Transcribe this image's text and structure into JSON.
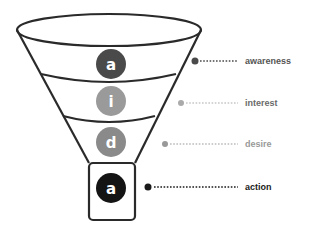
{
  "diagram": {
    "type": "funnel",
    "stages": [
      {
        "letter": "a",
        "label": "awareness",
        "circle_color": "#4a4a4a",
        "label_color": "#555555",
        "dot_color": "#4a4a4a"
      },
      {
        "letter": "i",
        "label": "interest",
        "circle_color": "#9a9a9a",
        "label_color": "#6a6a6a",
        "dot_color": "#aaaaaa"
      },
      {
        "letter": "d",
        "label": "desire",
        "circle_color": "#8a8a8a",
        "label_color": "#999999",
        "dot_color": "#999999"
      },
      {
        "letter": "a",
        "label": "action",
        "circle_color": "#141414",
        "label_color": "#1a1a1a",
        "dot_color": "#1a1a1a"
      }
    ],
    "outline_color": "#2a2a2a"
  }
}
